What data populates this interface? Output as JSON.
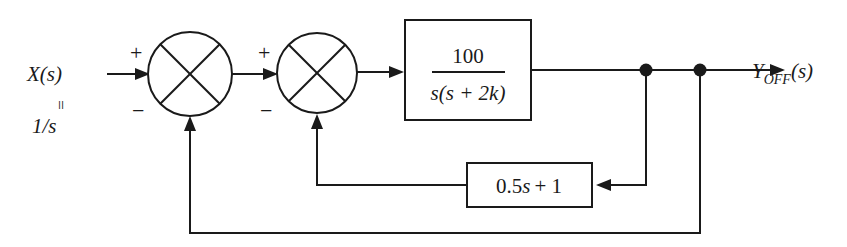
{
  "diagram": {
    "stroke_color": "#1a1a1a",
    "background_color": "#ffffff",
    "input": {
      "name_line1": "X(s)",
      "name_line1_main": "X",
      "name_line1_paren": "(s)",
      "equals_symbol": "=",
      "value": "1/s"
    },
    "output": {
      "base": "Y",
      "subscript": "OFF",
      "argument": "(s)"
    },
    "summing_junctions": [
      {
        "id": "sum-1",
        "plus_sign": "+",
        "minus_sign": "−",
        "cx": 190,
        "cy": 74,
        "r": 42
      },
      {
        "id": "sum-2",
        "plus_sign": "+",
        "minus_sign": "−",
        "cx": 317,
        "cy": 73,
        "r": 40
      }
    ],
    "plant_block": {
      "numerator": "100",
      "denominator_s": "s",
      "denominator_rest": "(s + 2k)",
      "denominator_full": "s(s + 2k)"
    },
    "feedback_block": {
      "coefficient": "0.5",
      "variable": "s",
      "constant": "+ 1",
      "label_full": "0.5s + 1"
    }
  }
}
